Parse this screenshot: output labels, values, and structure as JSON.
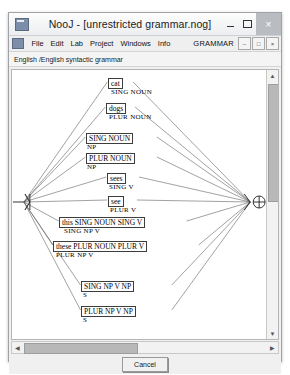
{
  "window": {
    "title": "NooJ - [unrestricted grammar.nog]",
    "app_icon": "app-window-icon",
    "minimize_label": "–",
    "maximize_label": "□",
    "close_label": "×"
  },
  "menubar": {
    "icon": "mdi-window-icon",
    "items": [
      {
        "label": "File"
      },
      {
        "label": "Edit"
      },
      {
        "label": "Lab"
      },
      {
        "label": "Project"
      },
      {
        "label": "Windows"
      },
      {
        "label": "Info"
      }
    ],
    "mode_label": "GRAMMAR",
    "mdi_buttons": [
      {
        "label": "–",
        "name": "mdi-minimize-button"
      },
      {
        "label": "□",
        "name": "mdi-restore-button"
      },
      {
        "label": "×",
        "name": "mdi-close-button"
      }
    ]
  },
  "document": {
    "header": "English /English  syntactic grammar"
  },
  "graph": {
    "start_node_label": "start-node",
    "end_node_label": "end-node",
    "nodes": [
      {
        "box": "cat",
        "label": "SING  NOUN",
        "bx": 96,
        "by": 8,
        "lx": 99,
        "ly": 18
      },
      {
        "box": "dogs",
        "label": "PLUR  NOUN",
        "bx": 94,
        "by": 33,
        "lx": 97,
        "ly": 43
      },
      {
        "box": "SING NOUN",
        "label": "NP",
        "bx": 74,
        "by": 63,
        "lx": 75,
        "ly": 73
      },
      {
        "box": "PLUR NOUN",
        "label": "NP",
        "bx": 74,
        "by": 83,
        "lx": 75,
        "ly": 93
      },
      {
        "box": "sees",
        "label": "SING  V",
        "bx": 95,
        "by": 103,
        "lx": 97,
        "ly": 113
      },
      {
        "box": "see",
        "label": "PLUR  V",
        "bx": 96,
        "by": 126,
        "lx": 98,
        "ly": 136
      },
      {
        "box": "this SING NOUN SING V",
        "label": "SING  NP  V",
        "bx": 47,
        "by": 147,
        "lx": 52,
        "ly": 157
      },
      {
        "box": "these PLUR NOUN PLUR V",
        "label": "PLUR  NP  V",
        "bx": 41,
        "by": 171,
        "lx": 44,
        "ly": 181
      },
      {
        "box": "SING NP V NP",
        "label": "S",
        "bx": 69,
        "by": 211,
        "lx": 71,
        "ly": 221
      },
      {
        "box": "PLUR NP V NP",
        "label": "S",
        "bx": 69,
        "by": 236,
        "lx": 71,
        "ly": 246
      }
    ]
  },
  "scrollbars": {
    "v_up": "▲",
    "v_down": "▼",
    "h_left": "◀",
    "h_right": "▶"
  },
  "footer": {
    "cancel_label": "Cancel"
  }
}
